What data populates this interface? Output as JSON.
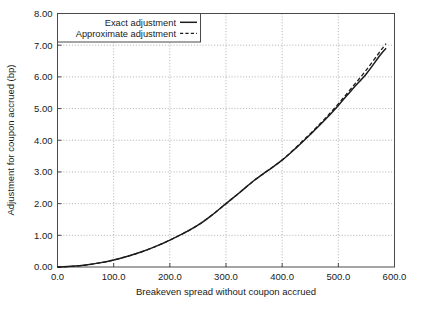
{
  "chart_data": {
    "type": "line",
    "title": "",
    "subtitle": "",
    "xlabel": "Breakeven spread without coupon accrued",
    "ylabel": "Adjustment for coupon accrued (bp)",
    "xlim": [
      0,
      600
    ],
    "ylim": [
      0,
      8
    ],
    "xticks": [
      0,
      100,
      200,
      300,
      400,
      500,
      600
    ],
    "xticklabels": [
      "0.0",
      "100.0",
      "200.0",
      "300.0",
      "400.0",
      "500.0",
      "600.0"
    ],
    "yticks": [
      0,
      1,
      2,
      3,
      4,
      5,
      6,
      7,
      8
    ],
    "yticklabels": [
      "0.00",
      "1.00",
      "2.00",
      "3.00",
      "4.00",
      "5.00",
      "6.00",
      "7.00",
      "8.00"
    ],
    "grid": true,
    "grid_style": "dotted",
    "legend_position": "top-center",
    "legend": [
      "Exact adjustment",
      "Approximate adjustment"
    ],
    "series": [
      {
        "name": "Exact adjustment",
        "style": "solid",
        "color": "#1c1c1c",
        "x": [
          0,
          25,
          50,
          75,
          100,
          125,
          150,
          175,
          200,
          225,
          250,
          275,
          300,
          325,
          350,
          375,
          400,
          425,
          450,
          475,
          500,
          525,
          550,
          575,
          585
        ],
        "y": [
          0.0,
          0.02,
          0.06,
          0.13,
          0.22,
          0.34,
          0.48,
          0.65,
          0.85,
          1.07,
          1.32,
          1.64,
          2.0,
          2.36,
          2.73,
          3.05,
          3.37,
          3.76,
          4.18,
          4.62,
          5.1,
          5.61,
          6.1,
          6.7,
          6.9
        ]
      },
      {
        "name": "Approximate adjustment",
        "style": "dashed",
        "color": "#1c1c1c",
        "x": [
          0,
          25,
          50,
          75,
          100,
          125,
          150,
          175,
          200,
          225,
          250,
          275,
          300,
          325,
          350,
          375,
          400,
          425,
          450,
          475,
          500,
          525,
          550,
          575,
          585
        ],
        "y": [
          0.0,
          0.02,
          0.06,
          0.13,
          0.22,
          0.34,
          0.48,
          0.65,
          0.85,
          1.07,
          1.32,
          1.64,
          2.0,
          2.36,
          2.73,
          3.05,
          3.38,
          3.78,
          4.21,
          4.66,
          5.15,
          5.68,
          6.22,
          6.82,
          7.05
        ]
      }
    ]
  },
  "legend": {
    "entries": [
      {
        "label": "Exact adjustment",
        "style": "solid"
      },
      {
        "label": "Approximate adjustment",
        "style": "dashed"
      }
    ]
  },
  "axes": {
    "x_title": "Breakeven spread without coupon accrued",
    "y_title": "Adjustment for coupon accrued (bp)"
  }
}
